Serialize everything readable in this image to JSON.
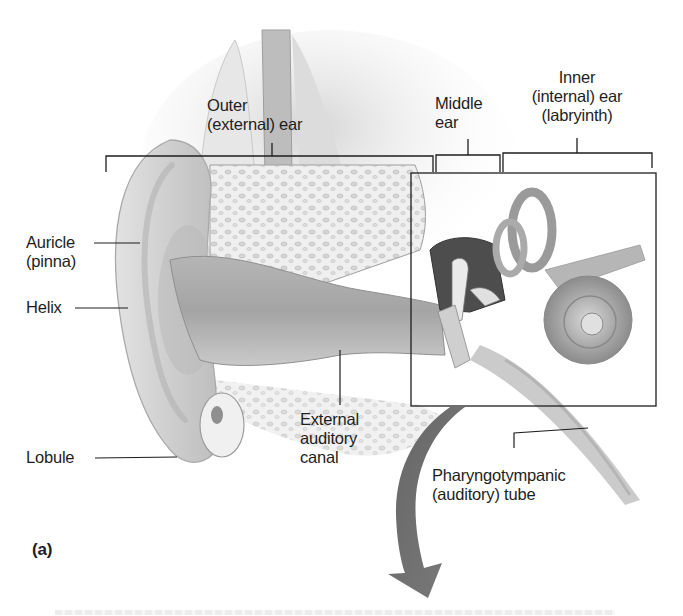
{
  "figure": {
    "panel_label": "(a)",
    "colors": {
      "ink": "#1e1e1e",
      "arrow": "#6e6e6e",
      "tissue_light": "#e6e6e6",
      "tissue_mid": "#bdbdbd",
      "tissue_dark": "#5a5a5a"
    }
  },
  "regions": [
    {
      "id": "outer",
      "lines": [
        "Outer",
        "(external) ear"
      ]
    },
    {
      "id": "middle",
      "lines": [
        "Middle",
        "ear"
      ]
    },
    {
      "id": "inner",
      "lines": [
        "Inner",
        "(internal) ear",
        "(labryinth)"
      ]
    }
  ],
  "labels": [
    {
      "id": "auricle",
      "lines": [
        "Auricle",
        "(pinna)"
      ]
    },
    {
      "id": "helix",
      "lines": [
        "Helix"
      ]
    },
    {
      "id": "lobule",
      "lines": [
        "Lobule"
      ]
    },
    {
      "id": "external-auditory-canal",
      "lines": [
        "External",
        "auditory",
        "canal"
      ]
    },
    {
      "id": "pharyngotympanic-tube",
      "lines": [
        "Pharyngotympanic",
        "(auditory) tube"
      ]
    }
  ]
}
